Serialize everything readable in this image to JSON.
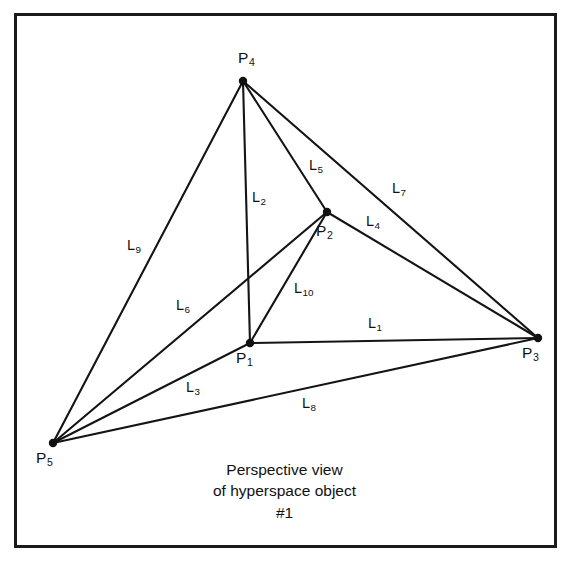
{
  "figure": {
    "title_caption": [
      "Perspective view",
      "of hyperspace object",
      "#1"
    ],
    "caption_line_1": "Perspective view",
    "caption_line_2": "of hyperspace object",
    "caption_line_3": "#1",
    "border_color": "#1a1a1a",
    "ink_color": "#111111",
    "background_color": "#ffffff"
  },
  "chart_data": {
    "type": "diagram",
    "title": "Perspective view of hyperspace object #1",
    "vertices": [
      {
        "id": "P1",
        "label": "P",
        "subscript": "1",
        "x": 250,
        "y": 343,
        "label_x": 236,
        "label_y": 350
      },
      {
        "id": "P2",
        "label": "P",
        "subscript": "2",
        "x": 327,
        "y": 212,
        "label_x": 316,
        "label_y": 223
      },
      {
        "id": "P3",
        "label": "P",
        "subscript": "3",
        "x": 538,
        "y": 338,
        "label_x": 522,
        "label_y": 345
      },
      {
        "id": "P4",
        "label": "P",
        "subscript": "4",
        "x": 243,
        "y": 81,
        "label_x": 238,
        "label_y": 50
      },
      {
        "id": "P5",
        "label": "P",
        "subscript": "5",
        "x": 53,
        "y": 443,
        "label_x": 36,
        "label_y": 450
      }
    ],
    "edges": [
      {
        "id": "L1",
        "label": "L",
        "subscript": "1",
        "from": "P1",
        "to": "P3",
        "label_x": 368,
        "label_y": 316
      },
      {
        "id": "L2",
        "label": "L",
        "subscript": "2",
        "from": "P4",
        "to": "P1",
        "label_x": 252,
        "label_y": 190
      },
      {
        "id": "L3",
        "label": "L",
        "subscript": "3",
        "from": "P1",
        "to": "P5",
        "label_x": 186,
        "label_y": 380
      },
      {
        "id": "L4",
        "label": "L",
        "subscript": "4",
        "from": "P2",
        "to": "P3",
        "label_x": 366,
        "label_y": 214
      },
      {
        "id": "L5",
        "label": "L",
        "subscript": "5",
        "from": "P4",
        "to": "P2",
        "label_x": 309,
        "label_y": 158
      },
      {
        "id": "L6",
        "label": "L",
        "subscript": "6",
        "from": "P2",
        "to": "P5",
        "label_x": 176,
        "label_y": 298
      },
      {
        "id": "L7",
        "label": "L",
        "subscript": "7",
        "from": "P4",
        "to": "P3",
        "label_x": 392,
        "label_y": 181
      },
      {
        "id": "L8",
        "label": "L",
        "subscript": "8",
        "from": "P5",
        "to": "P3",
        "label_x": 302,
        "label_y": 396
      },
      {
        "id": "L9",
        "label": "L",
        "subscript": "9",
        "from": "P4",
        "to": "P5",
        "label_x": 127,
        "label_y": 238
      },
      {
        "id": "L10",
        "label": "L",
        "subscript": "10",
        "from": "P1",
        "to": "P2",
        "label_x": 294,
        "label_y": 281
      }
    ],
    "vertex_count": 5,
    "edge_count": 10,
    "grid": false,
    "legend": "none"
  }
}
